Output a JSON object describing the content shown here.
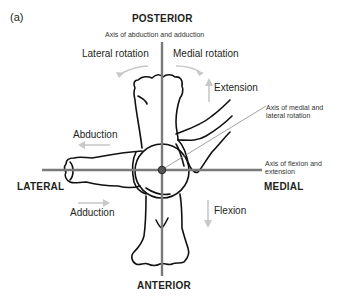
{
  "panel_label": "(a)",
  "directions": {
    "posterior": "POSTERIOR",
    "anterior": "ANTERIOR",
    "lateral": "LATERAL",
    "medial": "MEDIAL"
  },
  "axes": {
    "abduction_adduction": "Axis of abduction and adduction",
    "rotation_line1": "Axis of medial and",
    "rotation_line2": "lateral rotation",
    "flexion_line1": "Axis of flexion and",
    "flexion_line2": "extension"
  },
  "movements": {
    "lateral_rotation": "Lateral rotation",
    "medial_rotation": "Medial rotation",
    "extension": "Extension",
    "abduction": "Abduction",
    "adduction": "Adduction",
    "flexion": "Flexion"
  },
  "colors": {
    "axis": "#7a7a7a",
    "arrow": "#c8c8c8",
    "outline": "#111111"
  }
}
